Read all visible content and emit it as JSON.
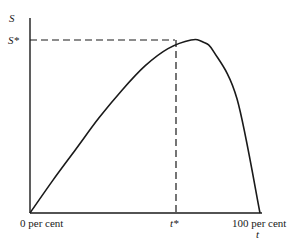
{
  "chart_data": {
    "type": "line",
    "title": "",
    "xlabel": "t",
    "ylabel": "S",
    "x_ticks": [
      "0 per cent",
      "t*",
      "100 per cent"
    ],
    "y_ticks": [
      "S*"
    ],
    "series": [
      {
        "name": "S(t)",
        "x": [
          0,
          10,
          20,
          30,
          40,
          50,
          60,
          70,
          75,
          80,
          90,
          100
        ],
        "values": [
          0,
          0.19,
          0.37,
          0.55,
          0.71,
          0.85,
          0.95,
          1.0,
          0.99,
          0.93,
          0.66,
          0
        ]
      }
    ],
    "annotations": [
      {
        "type": "dashed-hline",
        "label": "S*",
        "y": 1.0,
        "x_to": "t*"
      },
      {
        "type": "dashed-vline",
        "label": "t*",
        "x": 70,
        "y_to": "S*"
      }
    ],
    "xlim": [
      0,
      100
    ],
    "ylim": [
      0,
      1.1
    ],
    "grid": false,
    "legend": "none"
  },
  "labels": {
    "y_axis": "S",
    "y_star": "S*",
    "x_zero": "0 per cent",
    "x_star": "t*",
    "x_hundred": "100 per cent",
    "x_axis": "t"
  }
}
